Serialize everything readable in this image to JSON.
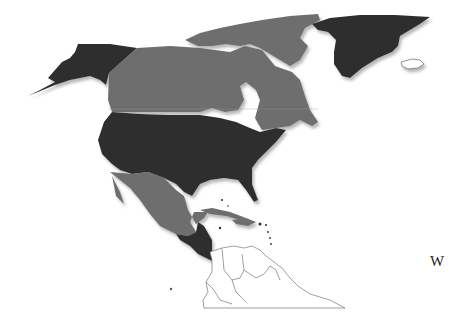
{
  "map": {
    "title": "",
    "label_w": "W",
    "colors": {
      "dark": "#2e2e2e",
      "medium": "#6e6e6e",
      "light_outline": "#ffffff",
      "outline_stroke": "#777777",
      "shadow": "#bbbbbb"
    },
    "regions": [
      {
        "name": "Alaska",
        "shade": "dark"
      },
      {
        "name": "Canada",
        "shade": "medium"
      },
      {
        "name": "Greenland",
        "shade": "dark"
      },
      {
        "name": "Iceland",
        "shade": "outline"
      },
      {
        "name": "United States",
        "shade": "dark"
      },
      {
        "name": "Mexico",
        "shade": "medium"
      },
      {
        "name": "Central America",
        "shade": "dark"
      },
      {
        "name": "Cuba",
        "shade": "medium"
      },
      {
        "name": "Hispaniola",
        "shade": "medium"
      },
      {
        "name": "South America (north)",
        "shade": "outline"
      }
    ]
  }
}
